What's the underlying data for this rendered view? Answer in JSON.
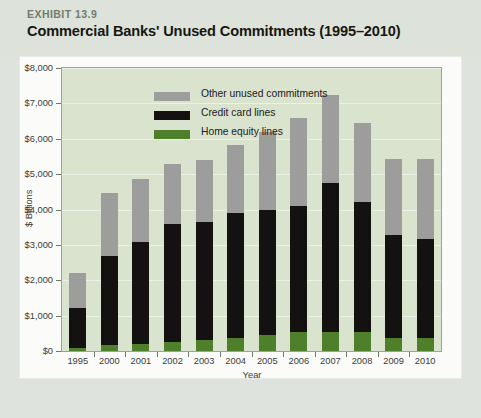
{
  "header": {
    "exhibit_label": "EXHIBIT 13.9",
    "title": "Commercial Banks' Unused Commitments (1995–2010)"
  },
  "colors": {
    "page_background": "#dfe3dd",
    "card_background": "#fbfbfa",
    "plot_background": "#d9e3ce",
    "plot_border": "#9aa692",
    "gridline": "#eef3e9",
    "home_equity": "#4e7f2a",
    "credit_card": "#131210",
    "other_unused": "#9d9d9c",
    "exhibit_label": "#6f7d6a",
    "title": "#16170f",
    "axis_text": "#3b3b38"
  },
  "chart_data": {
    "type": "bar",
    "stacked": true,
    "title": "Commercial Banks' Unused Commitments (1995–2010)",
    "xlabel": "Year",
    "ylabel": "$ Billions",
    "categories": [
      "1995",
      "2000",
      "2001",
      "2002",
      "2003",
      "2004",
      "2005",
      "2006",
      "2007",
      "2008",
      "2009",
      "2010"
    ],
    "ylim": [
      0,
      8000
    ],
    "ytick_values": [
      0,
      1000,
      2000,
      3000,
      4000,
      5000,
      6000,
      7000,
      8000
    ],
    "ytick_labels": [
      "$0",
      "$1,000",
      "$2,000",
      "$3,000",
      "$4,000",
      "$5,000",
      "$6,000",
      "$7,000",
      "$8,000"
    ],
    "grid": true,
    "legend_position": "upper-left-inside",
    "series": [
      {
        "name": "Home equity lines",
        "color": "#4e7f2a",
        "values": [
          90,
          180,
          210,
          260,
          300,
          380,
          450,
          530,
          550,
          540,
          370,
          360
        ]
      },
      {
        "name": "Credit card lines",
        "color": "#131210",
        "values": [
          1130,
          2500,
          2870,
          3330,
          3360,
          3530,
          3550,
          3580,
          4200,
          3680,
          2920,
          2800
        ]
      },
      {
        "name": "Other unused commitments",
        "color": "#9d9d9c",
        "values": [
          980,
          1800,
          1770,
          1700,
          1740,
          1910,
          2200,
          2490,
          2500,
          2230,
          2130,
          2270
        ]
      }
    ],
    "totals": [
      2200,
      4480,
      4850,
      5290,
      5400,
      5820,
      6200,
      6600,
      7250,
      6450,
      5420,
      5430
    ]
  },
  "legend": {
    "entries": [
      {
        "label": "Other unused commitments",
        "color": "#9d9d9c"
      },
      {
        "label": "Credit card lines",
        "color": "#131210"
      },
      {
        "label": "Home equity lines",
        "color": "#4e7f2a"
      }
    ]
  }
}
